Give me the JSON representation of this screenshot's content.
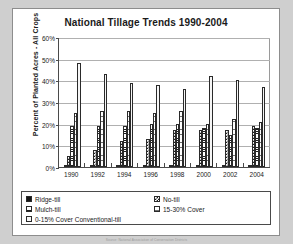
{
  "chart_data": {
    "type": "bar",
    "title": "National Tillage Trends 1990-2004",
    "xlabel": "",
    "ylabel": "Percent of Planted Acres - All Crops",
    "categories": [
      "1990",
      "1992",
      "1994",
      "1996",
      "1998",
      "2000",
      "2002",
      "2004"
    ],
    "ylim": [
      0,
      60
    ],
    "yticks": [
      "0%",
      "10%",
      "20%",
      "30%",
      "40%",
      "50%",
      "60%"
    ],
    "ytick_values": [
      0,
      10,
      20,
      30,
      40,
      50,
      60
    ],
    "grid": true,
    "legend_position": "bottom",
    "series": [
      {
        "name": "Ridge-till",
        "pattern": "solid-black",
        "values": [
          1,
          1,
          1,
          1,
          1,
          1,
          1,
          1
        ]
      },
      {
        "name": "No-till",
        "pattern": "checkerboard",
        "values": [
          5,
          8,
          12,
          13,
          17,
          17,
          17,
          19
        ]
      },
      {
        "name": "Mulch-till",
        "pattern": "horizontal-lines",
        "values": [
          19,
          19,
          19,
          20,
          20,
          18,
          15,
          18
        ]
      },
      {
        "name": "15-30% Cover",
        "pattern": "light-h-lines",
        "values": [
          25,
          26,
          26,
          25,
          26,
          20,
          22,
          21
        ]
      },
      {
        "name": "0-15% Cover Conventional-till",
        "pattern": "very-light-h-lines",
        "values": [
          48,
          43,
          39,
          38,
          36,
          42,
          40,
          37
        ]
      }
    ]
  },
  "legend": {
    "items": [
      {
        "label": "Ridge-till"
      },
      {
        "label": "No-till"
      },
      {
        "label": "Mulch-till"
      },
      {
        "label": "15-30% Cover"
      },
      {
        "label": "0-15% Cover Conventional-till"
      }
    ]
  },
  "source_note": "Source: National Association of Conservation Districts"
}
